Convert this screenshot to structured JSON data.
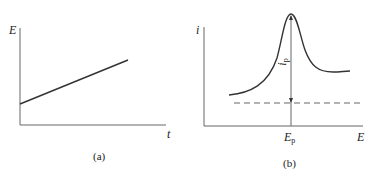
{
  "panels": {
    "a": {
      "caption": "(a)",
      "y_label": "E",
      "x_label": "t",
      "series": {
        "type": "line",
        "description": "Linearly increasing potential vs time (potential ramp)"
      }
    },
    "b": {
      "caption": "(b)",
      "y_label": "i",
      "x_label": "E",
      "peak_potential_label": {
        "main": "E",
        "sub": "p"
      },
      "peak_current_label": {
        "main": "i",
        "sub": "p"
      },
      "series": {
        "type": "curve",
        "description": "Current vs potential with a peak at E_p; dashed baseline; vertical double arrow indicating peak current i_p"
      }
    }
  },
  "colors": {
    "line": "#333333",
    "axis": "#555555",
    "dash": "#666666"
  }
}
